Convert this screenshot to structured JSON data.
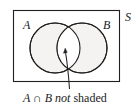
{
  "figure": {
    "type": "venn-diagram",
    "universal_set_label": "S",
    "set_labels": {
      "left": "A",
      "right": "B"
    },
    "caption": {
      "italic_part": "A ∩ B not",
      "roman_part": "shaded",
      "full": "A ∩ B not shaded"
    },
    "colors": {
      "circle_fill": "#f4f3f1",
      "unshaded_fill": "#ffffff",
      "stroke": "#231f20",
      "background": "#ffffff"
    },
    "geometry": {
      "rect": {
        "x": 13,
        "y": 10,
        "width": 107,
        "height": 72
      },
      "circle_left": {
        "cx": 55,
        "cy": 48,
        "r": 25
      },
      "circle_right": {
        "cx": 82,
        "cy": 48,
        "r": 25
      },
      "pointer": {
        "from_x": 69,
        "from_y": 88,
        "to_x": 65,
        "to_y": 49
      }
    }
  }
}
